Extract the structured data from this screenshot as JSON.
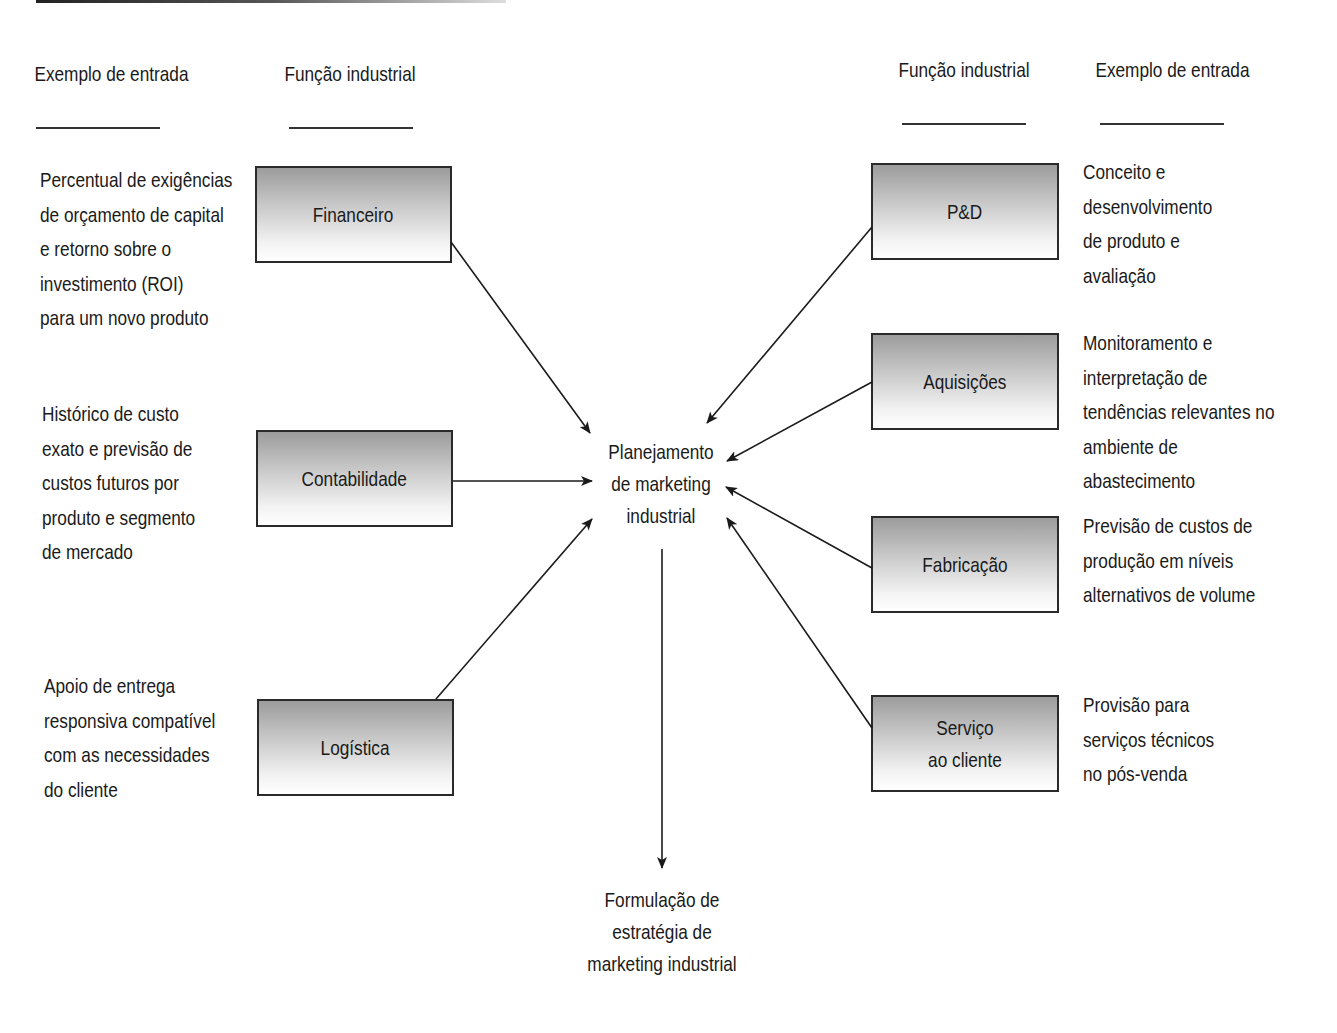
{
  "headers": {
    "left_example": "Exemplo de\nentrada",
    "left_function": "Função\nindustrial",
    "right_function": "Função\nindustrial",
    "right_example": "Exemplo de\nentrada"
  },
  "left_functions": [
    {
      "label": "Financeiro",
      "example": "Percentual de exigências\nde orçamento de capital\ne retorno sobre o\ninvestimento (ROI)\npara um novo produto"
    },
    {
      "label": "Contabilidade",
      "example": "Histórico de custo\nexato e previsão de\ncustos futuros por\nproduto e segmento\nde mercado"
    },
    {
      "label": "Logística",
      "example": "Apoio de entrega\nresponsiva compatível\ncom as necessidades\ndo cliente"
    }
  ],
  "right_functions": [
    {
      "label": "P&D",
      "example": "Conceito e\ndesenvolvimento\nde produto e\navaliação"
    },
    {
      "label": "Aquisições",
      "example": "Monitoramento e\ninterpretação de\ntendências relevantes no\nambiente de abastecimento"
    },
    {
      "label": "Fabricação",
      "example": "Previsão de custos de\nprodução em níveis\nalternativos de volume"
    },
    {
      "label": "Serviço\nao cliente",
      "example": "Provisão para\nserviços técnicos\nno pós-venda"
    }
  ],
  "center": {
    "label": "Planejamento\nde marketing\nindustrial"
  },
  "output": {
    "label": "Formulação de\nestratégia de\nmarketing industrial"
  },
  "colors": {
    "box_gradient_top": "#9c9c9c",
    "box_gradient_bottom": "#ffffff",
    "line": "#1a1a1a"
  }
}
